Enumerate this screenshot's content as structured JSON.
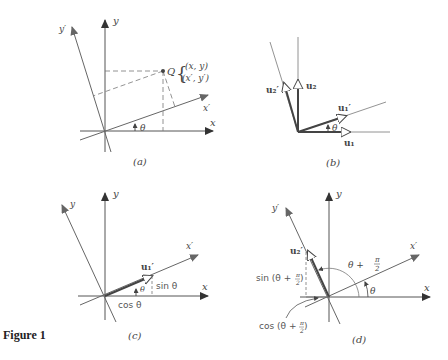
{
  "figure": {
    "title": "Figure 1",
    "panels": [
      {
        "id": "a",
        "caption": "(a)",
        "labels": {
          "x_axis": "x",
          "y_axis": "y",
          "x_prime_axis": "x′",
          "y_prime_axis": "y′",
          "angle": "θ",
          "point": "Q",
          "coords_original": "(x, y)",
          "coords_rotated": "(x′, y′)"
        }
      },
      {
        "id": "b",
        "caption": "(b)",
        "labels": {
          "u1": "u₁",
          "u2": "u₂",
          "u1_prime": "u₁′",
          "u2_prime": "u₂′",
          "angle": "θ"
        }
      },
      {
        "id": "c",
        "caption": "(c)",
        "labels": {
          "x_axis": "x",
          "y_axis": "y",
          "x_prime_axis": "x′",
          "y_prime_axis": "y",
          "u1_prime": "u₁′",
          "angle": "θ",
          "sin": "sin θ",
          "cos": "cos θ"
        }
      },
      {
        "id": "d",
        "caption": "(d)",
        "labels": {
          "x_axis": "x",
          "y_axis": "y",
          "x_prime_axis": "x′",
          "y_prime_axis": "y′",
          "u2_prime": "u₂′",
          "angle": "θ",
          "angle_sum_theta": "θ +",
          "pi": "π",
          "two": "2",
          "sin_prefix": "sin (θ +",
          "cos_prefix": "cos (θ +",
          "close_paren": ")"
        }
      }
    ]
  },
  "colors": {
    "axis": "#555555",
    "vector": "#444444",
    "dashed": "#777777",
    "text": "#444444"
  }
}
